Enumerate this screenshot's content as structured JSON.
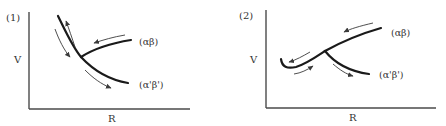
{
  "figure": {
    "panels": [
      {
        "id": "1",
        "label": "(1)",
        "y_axis_label": "V",
        "x_axis_label": "R",
        "curves": [
          {
            "name": "alpha-beta",
            "label": "(αβ)"
          },
          {
            "name": "alpha-prime-beta-prime",
            "label": "(α'β')"
          }
        ]
      },
      {
        "id": "2",
        "label": "(2)",
        "y_axis_label": "V",
        "x_axis_label": "R",
        "curves": [
          {
            "name": "alpha-beta",
            "label": "(αβ)"
          },
          {
            "name": "alpha-prime-beta-prime",
            "label": "(α'β')"
          }
        ]
      }
    ],
    "colors": {
      "curve": "#1a1a1a",
      "axis": "#4a4a4a",
      "text": "#333333",
      "background": "#ffffff"
    }
  }
}
